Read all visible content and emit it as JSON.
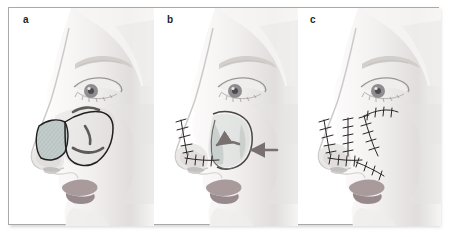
{
  "figure": {
    "domain": "medical-illustration",
    "panel_count": 3,
    "border_color": "#a9a9ac",
    "background_color": "#ffffff"
  },
  "palette": {
    "skin_light": "#f4f2f1",
    "skin_mid": "#e4e1e0",
    "skin_shadow": "#d2cfcf",
    "skin_deep": "#bdbabb",
    "lip": "#a99a9c",
    "lip_shadow": "#8e8083",
    "defect_fill": "#b9c4c2",
    "defect_hatch": "#7f8f8d",
    "flap_fill": "#cfd6d3",
    "ink": "#231f20",
    "arrow": "#78716f",
    "iris": "#8a8a8d",
    "brow": "#cac6c4",
    "suture": "#2b2726"
  },
  "panels": [
    {
      "id": "a",
      "label": "a",
      "caption_stage": "defect and flap design",
      "features": [
        "triangular nasal sidewall defect with cross-hatched raw surface",
        "cheek advancement flap outlined in ink",
        "curved rotation arcs marked on cheek"
      ]
    },
    {
      "id": "b",
      "label": "b",
      "caption_stage": "flap elevation and advancement",
      "features": [
        "sutured nasal dorsum and sidewall closure",
        "curved arrow indicating flap rotation",
        "straight arrow indicating medial advancement",
        "elevated flap margins outlined"
      ]
    },
    {
      "id": "c",
      "label": "c",
      "caption_stage": "completed closure",
      "features": [
        "branched suture lines along nasal sidewall",
        "suture line along nasofacial sulcus",
        "suture line extending onto cheek"
      ]
    }
  ]
}
